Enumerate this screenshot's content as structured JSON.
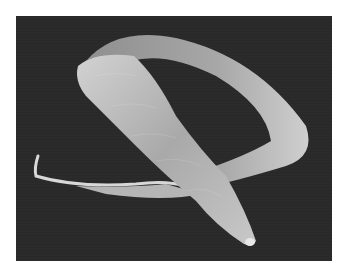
{
  "image": {
    "subject": "scanning electron micrograph of a nematode worm",
    "background_color": "#2b2b2b",
    "page_color": "#ffffff",
    "specimen_color": "#bdbdbd"
  }
}
